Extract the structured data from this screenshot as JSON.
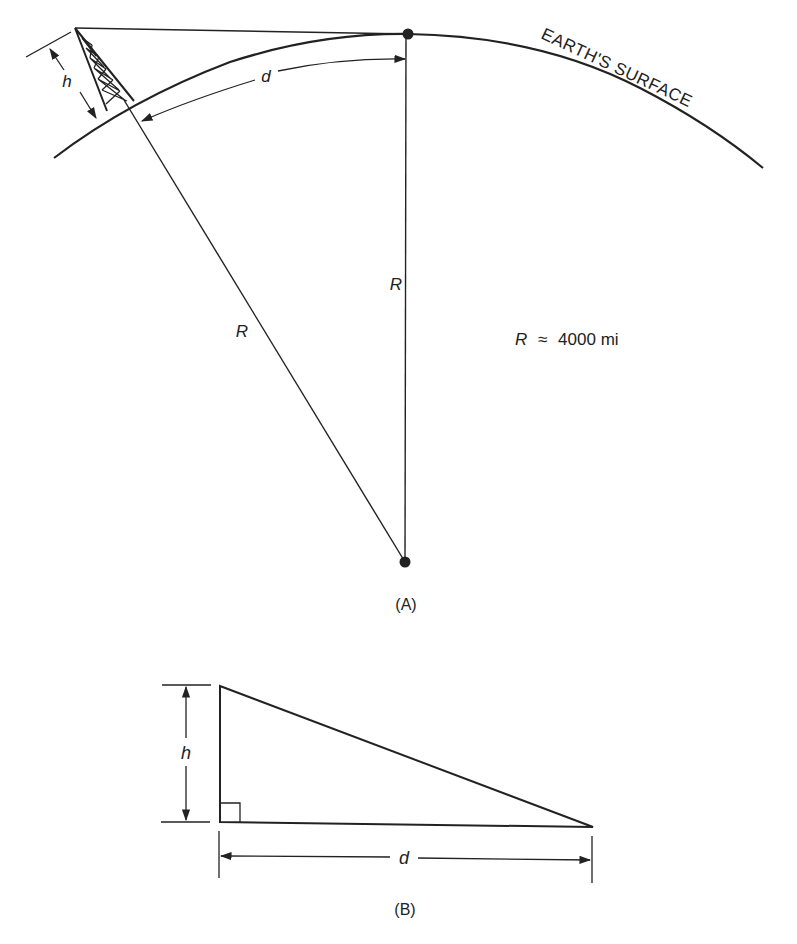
{
  "figure_a": {
    "caption": "(A)",
    "surface_label": "EARTH'S SURFACE",
    "height_label": "h",
    "arc_distance_label": "d",
    "radius_label_left": "R",
    "radius_label_vertical": "R",
    "radius_value": {
      "symbol": "R",
      "approx": "≈",
      "value": "4000 mi"
    }
  },
  "figure_b": {
    "caption": "(B)",
    "height_label": "h",
    "distance_label": "d"
  },
  "colors": {
    "ink": "#222222",
    "background": "#ffffff"
  }
}
